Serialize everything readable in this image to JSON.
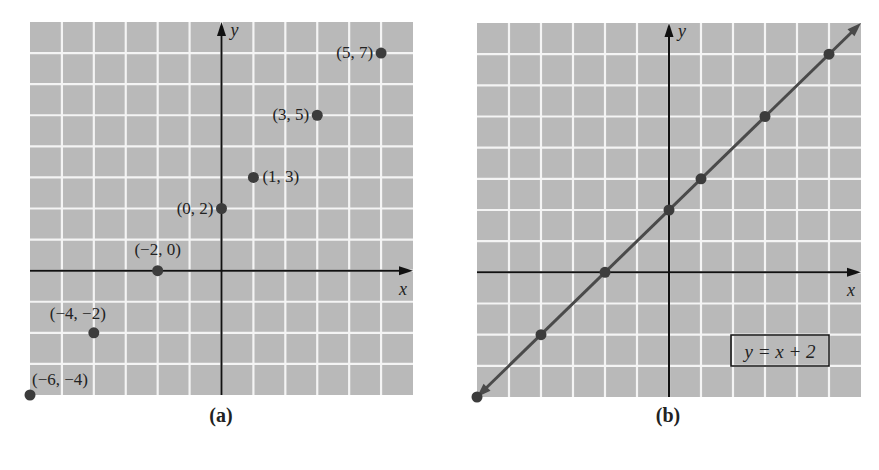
{
  "chart_data": [
    {
      "type": "scatter",
      "panel": "a",
      "caption": "(a)",
      "xlabel": "x",
      "ylabel": "y",
      "xlim": [
        -6,
        6
      ],
      "ylim": [
        -4,
        8
      ],
      "grid": true,
      "grid_step": 1,
      "points": [
        {
          "x": -6,
          "y": -4,
          "label": "(−6, −4)"
        },
        {
          "x": -4,
          "y": -2,
          "label": "(−4, −2)"
        },
        {
          "x": -2,
          "y": 0,
          "label": "(−2, 0)"
        },
        {
          "x": 0,
          "y": 2,
          "label": "(0, 2)"
        },
        {
          "x": 1,
          "y": 3,
          "label": "(1, 3)"
        },
        {
          "x": 3,
          "y": 5,
          "label": "(3, 5)"
        },
        {
          "x": 5,
          "y": 7,
          "label": "(5, 7)"
        }
      ]
    },
    {
      "type": "line",
      "panel": "b",
      "caption": "(b)",
      "xlabel": "x",
      "ylabel": "y",
      "xlim": [
        -6,
        6
      ],
      "ylim": [
        -4,
        8
      ],
      "grid": true,
      "grid_step": 1,
      "equation": "y = x + 2",
      "points": [
        {
          "x": -6,
          "y": -4
        },
        {
          "x": -4,
          "y": -2
        },
        {
          "x": -2,
          "y": 0
        },
        {
          "x": 0,
          "y": 2
        },
        {
          "x": 1,
          "y": 3
        },
        {
          "x": 3,
          "y": 5
        },
        {
          "x": 5,
          "y": 7
        }
      ]
    }
  ],
  "colors": {
    "grid_bg": "#b9b9b9",
    "grid_line": "#f4f4f4",
    "axis": "#111111",
    "point": "#3c3c3c",
    "line": "#4a4a4a"
  },
  "captions": {
    "a": "(a)",
    "b": "(b)"
  },
  "equation_label": "y = x + 2"
}
